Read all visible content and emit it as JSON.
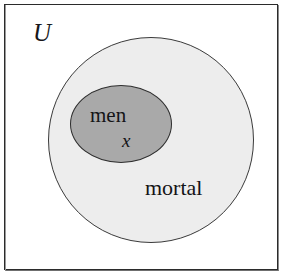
{
  "figure": {
    "type": "euler-diagram",
    "background_color": "#ffffff",
    "frame": {
      "name": "universe-box",
      "border_color": "#2b2b2b"
    },
    "universe_label": "U",
    "sets": [
      {
        "id": "mortal",
        "label": "mortal",
        "shape": "circle",
        "fill_color": "#ededed",
        "stroke_color": "#3a3a3a"
      },
      {
        "id": "men",
        "label": "men",
        "shape": "ellipse",
        "fill_color": "#a9a9a9",
        "stroke_color": "#2e2e2e"
      }
    ],
    "element_label": "x"
  }
}
